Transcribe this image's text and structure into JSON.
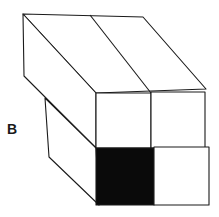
{
  "figure": {
    "label": "B",
    "colors": {
      "line": "#1a1a1a",
      "shaded": "#0a0a0a",
      "background": "#ffffff"
    },
    "front_grid": {
      "rows": 2,
      "cols": 2,
      "shaded_cells": [
        [
          1,
          0
        ]
      ]
    }
  }
}
